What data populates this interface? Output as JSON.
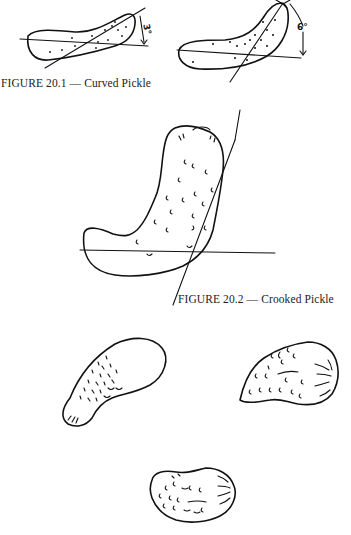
{
  "figures": [
    {
      "id": "20.1",
      "caption": "FIGURE 20.1 — Curved Pickle",
      "panels": [
        {
          "label": "curved-pickle-left",
          "angle_label": "3°"
        },
        {
          "label": "curved-pickle-right",
          "angle_label": "6°"
        }
      ]
    },
    {
      "id": "20.2",
      "caption": "FIGURE 20.2 — Crooked Pickle"
    }
  ],
  "unlabeled_drawings": [
    {
      "label": "pickle-sketch-bottom-left"
    },
    {
      "label": "pickle-sketch-bottom-right"
    },
    {
      "label": "pickle-sketch-bottom-center"
    }
  ]
}
